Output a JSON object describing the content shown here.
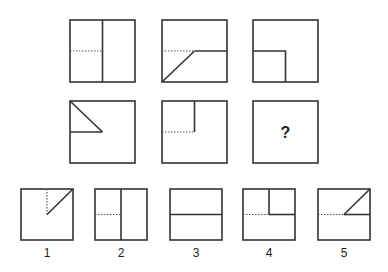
{
  "puzzle": {
    "question_mark": "?",
    "grid": [
      {
        "id": "r1c1",
        "desc": "square with vertical center line; dotted horizontal line in left half"
      },
      {
        "id": "r1c2",
        "desc": "square with dotted horizontal left half, solid horizontal right half, diagonal from bottom-left to center"
      },
      {
        "id": "r1c3",
        "desc": "square with small solid square in bottom-left quadrant"
      },
      {
        "id": "r2c1",
        "desc": "square with solid triangle in top-left quadrant"
      },
      {
        "id": "r2c2",
        "desc": "square with top-left quadrant outlined by solid vertical and dotted horizontal lines"
      },
      {
        "id": "r2c3",
        "desc": "missing figure"
      }
    ],
    "options": [
      {
        "label": "1"
      },
      {
        "label": "2"
      },
      {
        "label": "3"
      },
      {
        "label": "4"
      },
      {
        "label": "5"
      }
    ]
  }
}
